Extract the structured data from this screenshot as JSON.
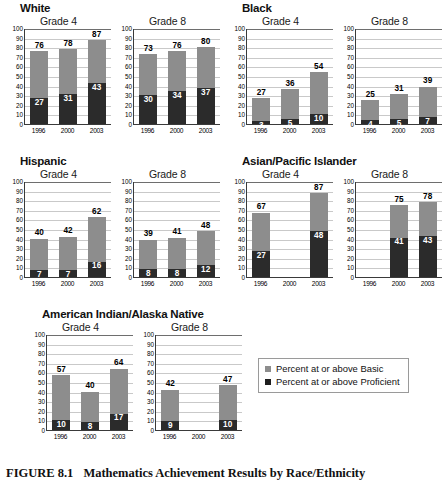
{
  "caption": {
    "figure_number": "FIGURE 8.1",
    "title": "Mathematics Achievement Results by Race/Ethnicity"
  },
  "legend": {
    "items": [
      {
        "label": "Percent at or above Basic",
        "color": "#8d8d8d",
        "key": "basic"
      },
      {
        "label": "Percent at or above Proficient",
        "color": "#1e1e1e",
        "key": "proficient"
      }
    ]
  },
  "axis": {
    "y_ticks": [
      100,
      90,
      80,
      70,
      60,
      50,
      40,
      30,
      20,
      10,
      0
    ],
    "y_min": 0,
    "y_max": 100,
    "x_categories": [
      "1996",
      "2000",
      "2003"
    ]
  },
  "groups": [
    {
      "name": "White",
      "panels": [
        {
          "title": "Grade 4",
          "basic": [
            76,
            78,
            87
          ],
          "proficient": [
            27,
            31,
            43
          ]
        },
        {
          "title": "Grade 8",
          "basic": [
            73,
            76,
            80
          ],
          "proficient": [
            30,
            34,
            37
          ]
        }
      ]
    },
    {
      "name": "Black",
      "panels": [
        {
          "title": "Grade 4",
          "basic": [
            27,
            36,
            54
          ],
          "proficient": [
            3,
            5,
            10
          ]
        },
        {
          "title": "Grade 8",
          "basic": [
            25,
            31,
            39
          ],
          "proficient": [
            4,
            5,
            7
          ]
        }
      ]
    },
    {
      "name": "Hispanic",
      "panels": [
        {
          "title": "Grade 4",
          "basic": [
            40,
            42,
            62
          ],
          "proficient": [
            7,
            7,
            16
          ]
        },
        {
          "title": "Grade 8",
          "basic": [
            39,
            41,
            48
          ],
          "proficient": [
            8,
            8,
            12
          ]
        }
      ]
    },
    {
      "name": "Asian/Pacific Islander",
      "panels": [
        {
          "title": "Grade 4",
          "basic": [
            67,
            null,
            87
          ],
          "proficient": [
            27,
            null,
            48
          ]
        },
        {
          "title": "Grade 8",
          "basic": [
            null,
            75,
            78
          ],
          "proficient": [
            null,
            41,
            43
          ]
        }
      ]
    },
    {
      "name": "American Indian/Alaska Native",
      "panels": [
        {
          "title": "Grade 4",
          "basic": [
            57,
            40,
            64
          ],
          "proficient": [
            10,
            8,
            17
          ]
        },
        {
          "title": "Grade 8",
          "basic": [
            42,
            null,
            47
          ],
          "proficient": [
            9,
            null,
            10
          ]
        }
      ]
    }
  ],
  "chart_data": {
    "type": "bar",
    "title": "Mathematics Achievement Results by Race/Ethnicity",
    "subtitle": "FIGURE 8.1",
    "xlabel": "",
    "ylabel": "",
    "ylim": [
      0,
      100
    ],
    "y_ticks": [
      0,
      10,
      20,
      30,
      40,
      50,
      60,
      70,
      80,
      90,
      100
    ],
    "grid": true,
    "legend_position": "bottom-right",
    "categories": [
      "1996",
      "2000",
      "2003"
    ],
    "note": "Each small multiple is an overlaid bar chart: the gray bar (Percent at or above Basic) is drawn full height and the black bar (Percent at or above Proficient) is overlaid in front of it from the baseline. Null means no data shown for that year.",
    "panels": [
      {
        "group": "White",
        "grade": "Grade 4",
        "series": [
          {
            "name": "Percent at or above Basic",
            "values": [
              76,
              78,
              87
            ]
          },
          {
            "name": "Percent at or above Proficient",
            "values": [
              27,
              31,
              43
            ]
          }
        ]
      },
      {
        "group": "White",
        "grade": "Grade 8",
        "series": [
          {
            "name": "Percent at or above Basic",
            "values": [
              73,
              76,
              80
            ]
          },
          {
            "name": "Percent at or above Proficient",
            "values": [
              30,
              34,
              37
            ]
          }
        ]
      },
      {
        "group": "Black",
        "grade": "Grade 4",
        "series": [
          {
            "name": "Percent at or above Basic",
            "values": [
              27,
              36,
              54
            ]
          },
          {
            "name": "Percent at or above Proficient",
            "values": [
              3,
              5,
              10
            ]
          }
        ]
      },
      {
        "group": "Black",
        "grade": "Grade 8",
        "series": [
          {
            "name": "Percent at or above Basic",
            "values": [
              25,
              31,
              39
            ]
          },
          {
            "name": "Percent at or above Proficient",
            "values": [
              4,
              5,
              7
            ]
          }
        ]
      },
      {
        "group": "Hispanic",
        "grade": "Grade 4",
        "series": [
          {
            "name": "Percent at or above Basic",
            "values": [
              40,
              42,
              62
            ]
          },
          {
            "name": "Percent at or above Proficient",
            "values": [
              7,
              7,
              16
            ]
          }
        ]
      },
      {
        "group": "Hispanic",
        "grade": "Grade 8",
        "series": [
          {
            "name": "Percent at or above Basic",
            "values": [
              39,
              41,
              48
            ]
          },
          {
            "name": "Percent at or above Proficient",
            "values": [
              8,
              8,
              12
            ]
          }
        ]
      },
      {
        "group": "Asian/Pacific Islander",
        "grade": "Grade 4",
        "series": [
          {
            "name": "Percent at or above Basic",
            "values": [
              67,
              null,
              87
            ]
          },
          {
            "name": "Percent at or above Proficient",
            "values": [
              27,
              null,
              48
            ]
          }
        ]
      },
      {
        "group": "Asian/Pacific Islander",
        "grade": "Grade 8",
        "series": [
          {
            "name": "Percent at or above Basic",
            "values": [
              null,
              75,
              78
            ]
          },
          {
            "name": "Percent at or above Proficient",
            "values": [
              null,
              41,
              43
            ]
          }
        ]
      },
      {
        "group": "American Indian/Alaska Native",
        "grade": "Grade 4",
        "series": [
          {
            "name": "Percent at or above Basic",
            "values": [
              57,
              40,
              64
            ]
          },
          {
            "name": "Percent at or above Proficient",
            "values": [
              10,
              8,
              17
            ]
          }
        ]
      },
      {
        "group": "American Indian/Alaska Native",
        "grade": "Grade 8",
        "series": [
          {
            "name": "Percent at or above Basic",
            "values": [
              42,
              null,
              47
            ]
          },
          {
            "name": "Percent at or above Proficient",
            "values": [
              9,
              null,
              10
            ]
          }
        ]
      }
    ]
  }
}
